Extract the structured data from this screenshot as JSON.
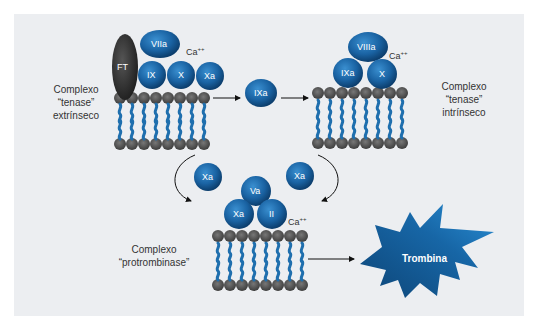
{
  "colors": {
    "background": "#eceef1",
    "protein_blue": "#1f6fae",
    "protein_dark": "#0d3f6e",
    "tissue_factor": "#2b2b2b",
    "membrane_head": "#555555",
    "thrombin": "#155a92"
  },
  "complexes": {
    "extrinsic": {
      "line1": "Complexo",
      "line2": "“tenase”",
      "line3": "extrínseco",
      "proteins": [
        "FT",
        "VIIa",
        "IX",
        "X",
        "Xa"
      ],
      "ion": "Ca"
    },
    "intrinsic": {
      "line1": "Complexo",
      "line2": "“tenase”",
      "line3": "intrínseco",
      "proteins": [
        "VIIIa",
        "IXa",
        "X"
      ],
      "ion": "Ca"
    },
    "prothrombinase": {
      "line1": "Complexo",
      "line2": "“protrombinase”",
      "proteins": [
        "Va",
        "Xa",
        "II"
      ],
      "ion": "Ca"
    }
  },
  "free_factors": {
    "ixa": "IXa",
    "xa_left": "Xa",
    "xa_right": "Xa"
  },
  "ion_charge": "++",
  "product": {
    "label": "Trombina"
  }
}
